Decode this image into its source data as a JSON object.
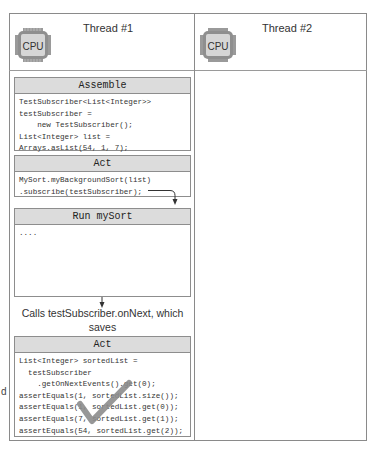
{
  "threads": [
    {
      "title": "Thread #1",
      "icon_label": "CPU"
    },
    {
      "title": "Thread #2",
      "icon_label": "CPU"
    }
  ],
  "panels": {
    "assemble": {
      "title": "Assemble",
      "code": "TestSubscriber<List<Integer>>\ntestSubscriber =\n    new TestSubscriber();\nList<Integer> list =\nArrays.asList(54, 1, 7);"
    },
    "act1": {
      "title": "Act",
      "code": "MySort.myBackgroundSort(list)\n.subscribe(testSubscriber);"
    },
    "run": {
      "title": "Run mySort",
      "code": "...."
    },
    "act2": {
      "title": "Act",
      "code": "List<Integer> sortedList =\n  testSubscriber\n    .getOnNextEvents().get(0);\nassertEquals(1, sortedList.size());\nassertEquals(1, sortedList.get(0));\nassertEquals(7, sortedList.get(1));\nassertEquals(54, sortedList.get(2));"
    }
  },
  "caption": {
    "line1": "Calls testSubscriber.onNext, which saves",
    "line2": "the results for your inspection"
  },
  "side_letter": "d",
  "colors": {
    "frame": "#8a8a8a",
    "panel_header": "#dcdcdc",
    "check": "#8c8c8c"
  }
}
